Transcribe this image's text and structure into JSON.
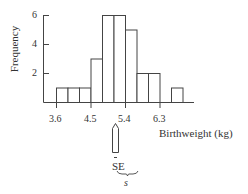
{
  "chart_data": {
    "type": "bar",
    "title": "",
    "xlabel": "Birthweight (kg)",
    "ylabel": "Frequency",
    "bin_edges": [
      3.6,
      3.9,
      4.2,
      4.5,
      4.8,
      5.1,
      5.4,
      5.7,
      6.0,
      6.3,
      6.6,
      6.9
    ],
    "values": [
      1,
      1,
      1,
      3,
      6,
      6,
      5,
      2,
      2,
      0,
      1
    ],
    "x_ticks": [
      "3.6",
      "4.5",
      "5.4",
      "6.3"
    ],
    "y_ticks": [
      "2",
      "4",
      "6"
    ],
    "ylim": [
      0,
      6
    ],
    "grid": false,
    "annotations": {
      "pointer": "arrow pointing up at sample mean",
      "se_label": "SE",
      "s_label": "s"
    }
  },
  "labels": {
    "ylabel": "Frequency",
    "xlabel": "Birthweight (kg)",
    "yt2": "2",
    "yt4": "4",
    "yt6": "6",
    "xt0": "3.6",
    "xt1": "4.5",
    "xt2": "5.4",
    "xt3": "6.3",
    "se": "SE",
    "s": "s"
  }
}
